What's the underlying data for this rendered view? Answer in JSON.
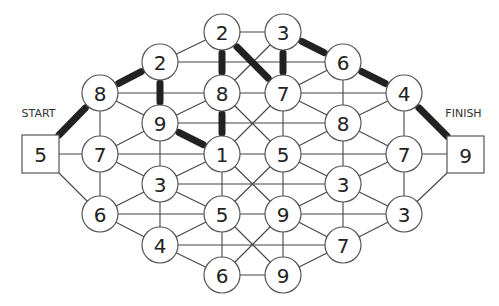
{
  "puzzle": {
    "top_caption_partial": "",
    "start": {
      "label": "START",
      "value": "5",
      "box": {
        "x": 22,
        "y": 135,
        "w": 37,
        "h": 38
      }
    },
    "finish": {
      "label": "FINISH",
      "value": "9",
      "box": {
        "x": 447,
        "y": 136,
        "w": 37,
        "h": 37
      }
    },
    "node_radius": 18,
    "nodes": [
      {
        "id": "A",
        "value": "2",
        "x": 222,
        "y": 32
      },
      {
        "id": "B",
        "value": "3",
        "x": 283,
        "y": 32
      },
      {
        "id": "C",
        "value": "2",
        "x": 160,
        "y": 62
      },
      {
        "id": "D",
        "value": "6",
        "x": 343,
        "y": 62
      },
      {
        "id": "E",
        "value": "8",
        "x": 100,
        "y": 93
      },
      {
        "id": "F",
        "value": "8",
        "x": 222,
        "y": 93
      },
      {
        "id": "G",
        "value": "7",
        "x": 283,
        "y": 93
      },
      {
        "id": "H",
        "value": "4",
        "x": 404,
        "y": 93
      },
      {
        "id": "I",
        "value": "9",
        "x": 160,
        "y": 123
      },
      {
        "id": "J",
        "value": "8",
        "x": 343,
        "y": 123
      },
      {
        "id": "K",
        "value": "7",
        "x": 100,
        "y": 154
      },
      {
        "id": "L",
        "value": "1",
        "x": 222,
        "y": 154
      },
      {
        "id": "M",
        "value": "5",
        "x": 283,
        "y": 154
      },
      {
        "id": "N",
        "value": "7",
        "x": 404,
        "y": 154
      },
      {
        "id": "O",
        "value": "3",
        "x": 160,
        "y": 184
      },
      {
        "id": "P",
        "value": "3",
        "x": 343,
        "y": 184
      },
      {
        "id": "Q",
        "value": "6",
        "x": 100,
        "y": 214
      },
      {
        "id": "R",
        "value": "5",
        "x": 222,
        "y": 214
      },
      {
        "id": "S",
        "value": "9",
        "x": 283,
        "y": 214
      },
      {
        "id": "T",
        "value": "3",
        "x": 404,
        "y": 214
      },
      {
        "id": "U",
        "value": "4",
        "x": 160,
        "y": 245
      },
      {
        "id": "V",
        "value": "7",
        "x": 343,
        "y": 245
      },
      {
        "id": "W",
        "value": "6",
        "x": 222,
        "y": 275
      },
      {
        "id": "X",
        "value": "9",
        "x": 283,
        "y": 275
      }
    ],
    "anchors": {
      "START": {
        "x": 41,
        "y": 154
      },
      "START_TR": {
        "x": 59,
        "y": 135
      },
      "START_R": {
        "x": 59,
        "y": 154
      },
      "START_BR": {
        "x": 59,
        "y": 173
      },
      "FINISH": {
        "x": 465,
        "y": 154
      },
      "FINISH_TL": {
        "x": 447,
        "y": 136
      },
      "FINISH_L": {
        "x": 447,
        "y": 154
      },
      "FINISH_BL": {
        "x": 447,
        "y": 173
      }
    },
    "edges": [
      [
        "C",
        "A"
      ],
      [
        "A",
        "B"
      ],
      [
        "C",
        "D"
      ],
      [
        "B",
        "F"
      ],
      [
        "G",
        "D"
      ],
      [
        "E",
        "F"
      ],
      [
        "F",
        "G"
      ],
      [
        "G",
        "H"
      ],
      [
        "E",
        "I"
      ],
      [
        "I",
        "F"
      ],
      [
        "E",
        "K"
      ],
      [
        "I",
        "O"
      ],
      [
        "I",
        "J"
      ],
      [
        "F",
        "M"
      ],
      [
        "G",
        "L"
      ],
      [
        "G",
        "M"
      ],
      [
        "G",
        "J"
      ],
      [
        "D",
        "J"
      ],
      [
        "J",
        "H"
      ],
      [
        "J",
        "N"
      ],
      [
        "H",
        "N"
      ],
      [
        "J",
        "P"
      ],
      [
        "M",
        "J"
      ],
      [
        "K",
        "I"
      ],
      [
        "K",
        "L"
      ],
      [
        "K",
        "O"
      ],
      [
        "O",
        "L"
      ],
      [
        "L",
        "M"
      ],
      [
        "L",
        "R"
      ],
      [
        "L",
        "S"
      ],
      [
        "M",
        "R"
      ],
      [
        "M",
        "S"
      ],
      [
        "M",
        "N"
      ],
      [
        "M",
        "P"
      ],
      [
        "N",
        "P"
      ],
      [
        "N",
        "T"
      ],
      [
        "O",
        "P"
      ],
      [
        "O",
        "R"
      ],
      [
        "O",
        "U"
      ],
      [
        "K",
        "Q"
      ],
      [
        "Q",
        "O"
      ],
      [
        "Q",
        "R"
      ],
      [
        "Q",
        "U"
      ],
      [
        "R",
        "S"
      ],
      [
        "R",
        "U"
      ],
      [
        "S",
        "P"
      ],
      [
        "S",
        "T"
      ],
      [
        "P",
        "T"
      ],
      [
        "P",
        "V"
      ],
      [
        "S",
        "V"
      ],
      [
        "R",
        "W"
      ],
      [
        "R",
        "X"
      ],
      [
        "S",
        "W"
      ],
      [
        "S",
        "X"
      ],
      [
        "U",
        "V"
      ],
      [
        "U",
        "W"
      ],
      [
        "W",
        "X"
      ],
      [
        "X",
        "V"
      ],
      [
        "V",
        "T"
      ],
      [
        "START_R",
        "K"
      ],
      [
        "START_BR",
        "Q"
      ],
      [
        "N",
        "FINISH_L"
      ],
      [
        "T",
        "FINISH_BL"
      ]
    ],
    "bold_path": [
      [
        "START_TR",
        "E"
      ],
      [
        "E",
        "C"
      ],
      [
        "C",
        "I"
      ],
      [
        "I",
        "L"
      ],
      [
        "L",
        "F"
      ],
      [
        "F",
        "A"
      ],
      [
        "A",
        "G"
      ],
      [
        "G",
        "B"
      ],
      [
        "B",
        "D"
      ],
      [
        "D",
        "H"
      ],
      [
        "H",
        "FINISH_TL"
      ]
    ],
    "path_sequence": [
      "5",
      "8",
      "2",
      "9",
      "1",
      "8",
      "2",
      "7",
      "3",
      "6",
      "4",
      "9"
    ]
  }
}
